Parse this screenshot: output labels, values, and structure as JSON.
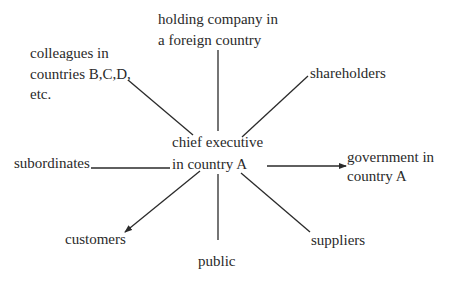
{
  "diagram": {
    "type": "hub-and-spoke",
    "center": {
      "line1": "chief executive",
      "line2": "in country A"
    },
    "nodes": {
      "holding_company": {
        "line1": "holding company in",
        "line2": "a foreign country"
      },
      "colleagues": {
        "line1": "colleagues in",
        "line2": "countries B,C,D,",
        "line3": "etc."
      },
      "shareholders": {
        "line1": "shareholders"
      },
      "subordinates": {
        "line1": "subordinates"
      },
      "government": {
        "line1": "government in",
        "line2": "country A"
      },
      "customers": {
        "line1": "customers"
      },
      "public": {
        "line1": "public"
      },
      "suppliers": {
        "line1": "suppliers"
      }
    },
    "edges": [
      {
        "from": "chief executive in country A",
        "to": "holding company in a foreign country",
        "arrow": false
      },
      {
        "from": "chief executive in country A",
        "to": "colleagues in countries B,C,D, etc.",
        "arrow": false
      },
      {
        "from": "chief executive in country A",
        "to": "shareholders",
        "arrow": false
      },
      {
        "from": "chief executive in country A",
        "to": "subordinates",
        "arrow": false
      },
      {
        "from": "chief executive in country A",
        "to": "government in country A",
        "arrow": true
      },
      {
        "from": "chief executive in country A",
        "to": "customers",
        "arrow": true
      },
      {
        "from": "chief executive in country A",
        "to": "public",
        "arrow": false
      },
      {
        "from": "chief executive in country A",
        "to": "suppliers",
        "arrow": false
      }
    ],
    "colors": {
      "ink": "#2a2a2a",
      "background": "#ffffff"
    }
  }
}
